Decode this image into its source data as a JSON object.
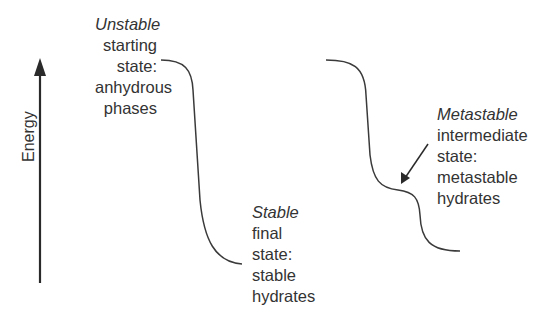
{
  "axis": {
    "label": "Energy",
    "direction": "up"
  },
  "states": {
    "unstable": {
      "qualifier": "Unstable",
      "lines": [
        "starting",
        "state:",
        "anhydrous",
        "phases"
      ]
    },
    "stable": {
      "qualifier": "Stable",
      "lines": [
        "final",
        "state:",
        "stable",
        "hydrates"
      ]
    },
    "metastable": {
      "qualifier": "Metastable",
      "lines": [
        "intermediate",
        "state:",
        "metastable",
        "hydrates"
      ]
    }
  },
  "colors": {
    "line": "#3a3a3a",
    "text": "#333333",
    "background": "#ffffff"
  }
}
